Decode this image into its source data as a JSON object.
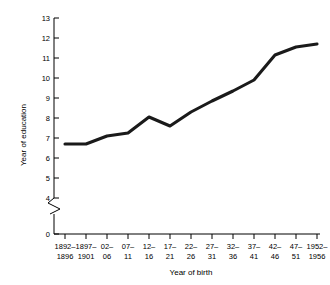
{
  "chart_data": {
    "type": "line",
    "title": "",
    "xlabel": "Year of birth",
    "ylabel": "Year of education",
    "categories": [
      "1892–\n1896",
      "1897–\n1901",
      "02–\n06",
      "07–\n11",
      "12–\n16",
      "17–\n21",
      "22–\n26",
      "27–\n31",
      "32–\n36",
      "37–\n41",
      "42–\n46",
      "47–\n51",
      "1952–\n1956"
    ],
    "categories_line1": [
      "1892–",
      "1897–",
      "02–",
      "07–",
      "12–",
      "17–",
      "22–",
      "27–",
      "32–",
      "37–",
      "42–",
      "47–",
      "1952–"
    ],
    "categories_line2": [
      "1896",
      "1901",
      "06",
      "11",
      "16",
      "21",
      "26",
      "31",
      "36",
      "41",
      "46",
      "51",
      "1956"
    ],
    "values": [
      6.7,
      6.7,
      7.1,
      7.25,
      8.05,
      7.6,
      8.3,
      8.85,
      9.35,
      9.9,
      11.15,
      11.55,
      11.7
    ],
    "series": [
      {
        "name": "Year of education",
        "values": [
          6.7,
          6.7,
          7.1,
          7.25,
          8.05,
          7.6,
          8.3,
          8.85,
          9.35,
          9.9,
          11.15,
          11.55,
          11.7
        ]
      }
    ],
    "ylim": [
      0,
      13
    ],
    "yticks": [
      0,
      4,
      5,
      6,
      7,
      8,
      9,
      10,
      11,
      12,
      13
    ],
    "ytick_labels": [
      "0",
      "4",
      "5",
      "6",
      "7",
      "8",
      "9",
      "10",
      "11",
      "12",
      "13"
    ],
    "axis_break": {
      "present": true,
      "between": [
        0,
        4
      ],
      "style": "zigzag"
    },
    "grid": false,
    "legend": null,
    "line_color": "#1a1a1a",
    "background_color": "#ffffff"
  },
  "axes": {
    "y_title": "Year of education",
    "x_title": "Year of birth"
  }
}
